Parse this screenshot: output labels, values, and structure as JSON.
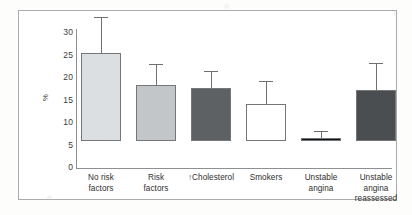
{
  "figure": {
    "frame_border_color": "#a9abad",
    "background_color": "#ffffff"
  },
  "chart_data": {
    "type": "bar",
    "title": "",
    "subtitle": "",
    "xlabel": "",
    "ylabel": "%",
    "ylim": [
      0,
      30
    ],
    "ytick_values": [
      0,
      5,
      10,
      15,
      20,
      25,
      30
    ],
    "ytick_labels": [
      "0",
      "5",
      "10",
      "15",
      "20",
      "25",
      "30"
    ],
    "grid": false,
    "legend": false,
    "legend_position": "none",
    "error_bars": "upper only (one-sided whisker with cap)",
    "categories": [
      "No risk factors",
      "Risk factors",
      "↑Cholesterol",
      "Smokers",
      "Unstable angina",
      "Unstable angina reassessed"
    ],
    "category_lines": [
      [
        "No risk",
        "factors"
      ],
      [
        "Risk",
        "factors"
      ],
      [
        "↑Cholesterol"
      ],
      [
        "Smokers"
      ],
      [
        "Unstable",
        "angina"
      ],
      [
        "Unstable",
        "angina",
        "reassessed"
      ]
    ],
    "values": [
      19.0,
      12.0,
      11.5,
      8.0,
      0.7,
      11.0
    ],
    "error_upper": [
      26.5,
      16.5,
      15.0,
      12.7,
      2.0,
      16.7
    ],
    "bar_colors": [
      "#dcdfe1",
      "#c3c6c8",
      "#5e6164",
      "#ffffff",
      "#111111",
      "#4b4e51"
    ],
    "bar_border_color": "#74777a",
    "axis_color": "#8d9093",
    "error_bar_color": "#6d7073"
  }
}
